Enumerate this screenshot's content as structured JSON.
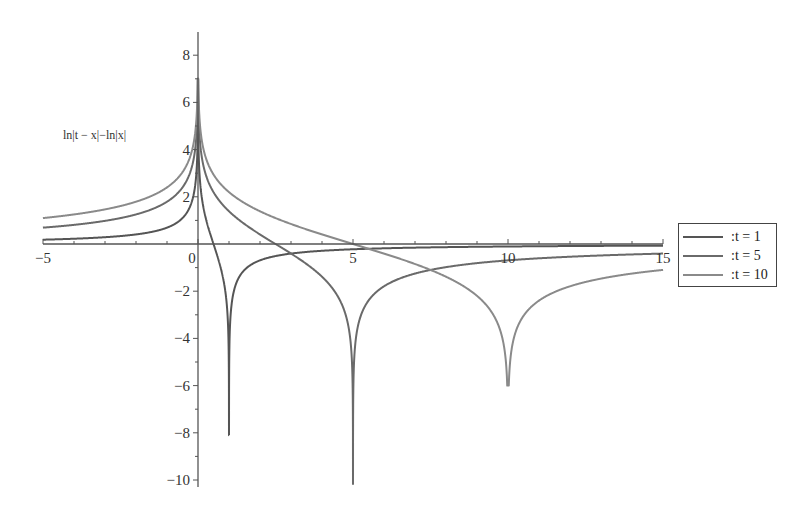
{
  "chart_data": {
    "type": "line",
    "title": "",
    "function": "ln|t - x| - ln|x|",
    "ylabel": "ln|t − x|−ln|x|",
    "xlabel": "",
    "xlim": [
      -5,
      15
    ],
    "ylim": [
      -10.3,
      9
    ],
    "x_ticks": [
      -5,
      0,
      5,
      10,
      15
    ],
    "x_tick_labels": [
      "−5",
      "0",
      "5",
      "10",
      "15"
    ],
    "y_ticks": [
      -10,
      -8,
      -6,
      -4,
      -2,
      2,
      4,
      6,
      8
    ],
    "y_tick_labels": [
      "−10",
      "−8",
      "−6",
      "−4",
      "−2",
      "2",
      "4",
      "6",
      "8"
    ],
    "grid": false,
    "legend_position": "right",
    "series": [
      {
        "name": ":t = 1",
        "t": 1,
        "color": "#555555",
        "min_spike": -8.1,
        "values_at": {
          "x=-5": 0.18,
          "x=15": -0.07
        }
      },
      {
        "name": ":t = 5",
        "t": 5,
        "color": "#6a6a6a",
        "min_spike": -10.2,
        "values_at": {
          "x=-5": 0.69,
          "x=2.5": 0,
          "x=15": -0.41
        }
      },
      {
        "name": ":t = 10",
        "t": 10,
        "color": "#8a8a8a",
        "min_spike": -6.0,
        "values_at": {
          "x=-5": 1.1,
          "x=5": 0,
          "x=15": -1.1
        }
      }
    ],
    "peak_near_x0": 7.0
  },
  "legend": {
    "items": [
      {
        "label": ":t = 1",
        "color": "#555555"
      },
      {
        "label": ":t = 5",
        "color": "#6a6a6a"
      },
      {
        "label": ":t = 10",
        "color": "#8a8a8a"
      }
    ]
  }
}
